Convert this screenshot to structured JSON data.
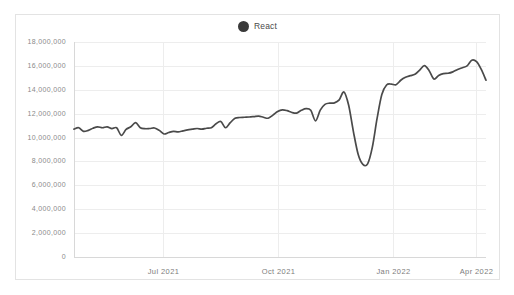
{
  "legend": {
    "position": "top-center",
    "items": [
      {
        "label": "React",
        "color": "#3a3a3a",
        "marker": "circle"
      }
    ]
  },
  "colors": {
    "line": "#4a4a4a",
    "grid": "#ededed",
    "axis": "#d8d8d8",
    "card_border": "#e3e3e3",
    "tick_text": "#8a8a8a",
    "background": "#ffffff"
  },
  "chart_data": {
    "type": "line",
    "title": "",
    "xlabel": "",
    "ylabel": "",
    "grid": true,
    "legend_position": "top-center",
    "ylim": [
      0,
      18000000
    ],
    "ytick_labels": [
      "18,000,000",
      "16,000,000",
      "14,000,000",
      "12,000,000",
      "10,000,000",
      "8,000,000",
      "6,000,000",
      "4,000,000",
      "2,000,000",
      "0"
    ],
    "ytick_values": [
      18000000,
      16000000,
      14000000,
      12000000,
      10000000,
      8000000,
      6000000,
      4000000,
      2000000,
      0
    ],
    "xtick_labels": [
      "Jul 2021",
      "Oct 2021",
      "Jan 2022",
      "Apr 2022"
    ],
    "xtick_positions": [
      0.215,
      0.495,
      0.775,
      0.975
    ],
    "xlim_description": "approx May 2021 through Apr 2022, weekly samples",
    "series": [
      {
        "name": "React",
        "color": "#3a3a3a",
        "values": [
          10700000,
          10820000,
          10520000,
          10600000,
          10780000,
          10900000,
          10820000,
          10900000,
          10750000,
          10820000,
          10180000,
          10680000,
          10900000,
          11250000,
          10820000,
          10740000,
          10760000,
          10800000,
          10600000,
          10300000,
          10420000,
          10520000,
          10480000,
          10560000,
          10640000,
          10700000,
          10760000,
          10700000,
          10780000,
          10820000,
          11150000,
          11350000,
          10820000,
          11250000,
          11620000,
          11680000,
          11700000,
          11720000,
          11760000,
          11800000,
          11700000,
          11620000,
          11880000,
          12180000,
          12320000,
          12250000,
          12100000,
          12050000,
          12280000,
          12420000,
          12280000,
          11400000,
          12300000,
          12780000,
          12880000,
          12900000,
          13150000,
          13820000,
          12700000,
          10500000,
          8600000,
          7750000,
          7800000,
          9200000,
          11600000,
          13600000,
          14400000,
          14480000,
          14420000,
          14800000,
          15050000,
          15180000,
          15300000,
          15650000,
          16020000,
          15600000,
          14900000,
          15200000,
          15350000,
          15380000,
          15500000,
          15700000,
          15850000,
          16000000,
          16480000,
          16350000,
          15700000,
          14800000
        ]
      }
    ]
  }
}
